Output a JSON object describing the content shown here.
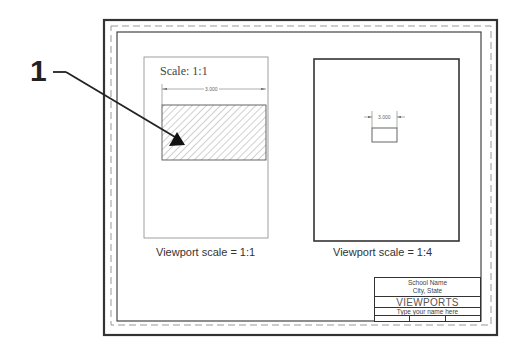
{
  "figure": {
    "callout": {
      "number": "1"
    },
    "left_viewport": {
      "inner_label": "Scale: 1:1",
      "dimension": "3.000",
      "caption": "Viewport scale = 1:1",
      "content": "hatched-rectangle"
    },
    "right_viewport": {
      "dimension": "3.000",
      "caption": "Viewport scale = 1:4",
      "content": "small-rectangle"
    },
    "title_block": {
      "school_name": "School Name",
      "city_state": "City, State",
      "title": "VIEWPORTS",
      "name_field": "Type your name here",
      "bottom_cells": [
        "",
        "",
        ""
      ]
    },
    "colors": {
      "frame": "#333333",
      "viewport_left_border": "#888888",
      "viewport_right_border": "#333333",
      "hatch": "#777777",
      "arrow": "#222222"
    }
  }
}
